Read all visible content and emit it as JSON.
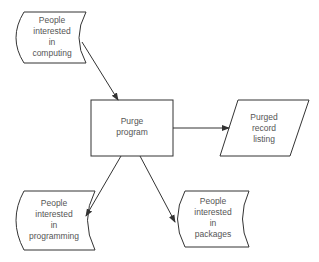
{
  "diagram": {
    "type": "flowchart",
    "nodes": [
      {
        "id": "computing",
        "shape": "stored-data",
        "label": "People\ninterested\nin\ncomputing"
      },
      {
        "id": "purge",
        "shape": "process",
        "label": "Purge\nprogram"
      },
      {
        "id": "listing",
        "shape": "input-output",
        "label": "Purged\nrecord\nlisting"
      },
      {
        "id": "programming",
        "shape": "stored-data",
        "label": "People\ninterested\nin\nprogramming"
      },
      {
        "id": "packages",
        "shape": "stored-data",
        "label": "People\ninterested\nin\npackages"
      }
    ],
    "edges": [
      {
        "from": "computing",
        "to": "purge"
      },
      {
        "from": "purge",
        "to": "listing"
      },
      {
        "from": "purge",
        "to": "programming"
      },
      {
        "from": "purge",
        "to": "packages"
      }
    ],
    "colors": {
      "stroke": "#333333",
      "text": "#555555",
      "background": "#ffffff"
    }
  }
}
